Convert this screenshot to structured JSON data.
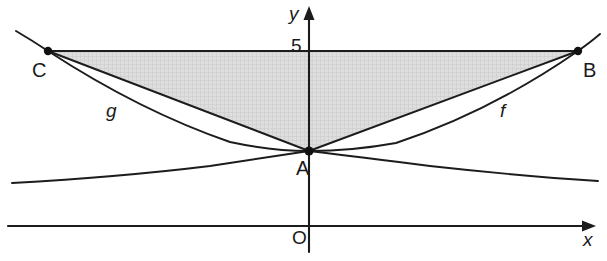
{
  "figure": {
    "background_color": "#ffffff",
    "stroke_color": "#1c1c1c",
    "shade_color": "#d6d6d6",
    "width": 607,
    "height": 261
  },
  "axes": {
    "x_axis": {
      "label": "x",
      "pixel_y": 226,
      "x_start": 8,
      "x_end": 588,
      "arrow": "right"
    },
    "y_axis": {
      "label": "y",
      "pixel_x": 309,
      "y_start": 252,
      "y_end": 14,
      "arrow": "up"
    },
    "origin_label": "O"
  },
  "ticks": [
    {
      "label": "5",
      "axis": "y",
      "value": 5,
      "pixel_y": 51
    }
  ],
  "points": [
    {
      "name": "A",
      "label": "A",
      "pixel_x": 309,
      "pixel_y": 151,
      "on_axis": "y-axis",
      "marked": false
    },
    {
      "name": "B",
      "label": "B",
      "pixel_x": 578,
      "pixel_y": 51,
      "on_axis": "y=5",
      "marked": true
    },
    {
      "name": "C",
      "label": "C",
      "pixel_x": 48,
      "pixel_y": 51,
      "on_axis": "y=5",
      "marked": true
    }
  ],
  "curves": [
    {
      "name": "f",
      "label": "f",
      "type": "parabola",
      "opens": "up",
      "vertex": "A",
      "passes_through": [
        "A",
        "B"
      ],
      "label_pixel_x": 505,
      "label_pixel_y": 112
    },
    {
      "name": "g",
      "label": "g",
      "type": "parabola",
      "opens": "up",
      "vertex": "A",
      "passes_through": [
        "A",
        "C"
      ],
      "label_pixel_x": 113,
      "label_pixel_y": 112
    },
    {
      "name": "h",
      "label": "",
      "type": "curve",
      "opens": "down",
      "vertex": "A",
      "passes_through": [
        "A"
      ],
      "label_pixel_x": null,
      "label_pixel_y": null
    }
  ],
  "segments": [
    {
      "name": "CB",
      "from": "C",
      "to": "B",
      "kind": "horizontal-level-line",
      "level": 5
    },
    {
      "name": "CA",
      "from": "C",
      "to": "A",
      "kind": "chord"
    },
    {
      "name": "AB",
      "from": "A",
      "to": "B",
      "kind": "chord"
    }
  ],
  "shaded_region": {
    "name": "triangle-CAB",
    "vertices": [
      "C",
      "A",
      "B"
    ],
    "fill": "#d6d6d6",
    "pattern": "fine-cross-hatch"
  }
}
